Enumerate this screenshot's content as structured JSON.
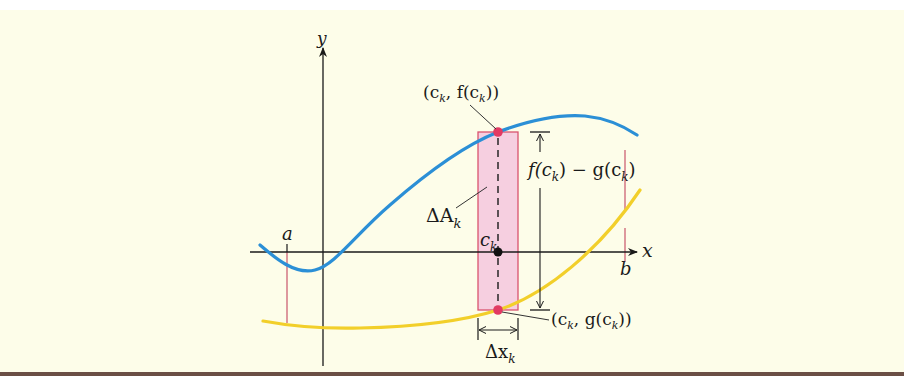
{
  "figure": {
    "colors": {
      "background": "#fdfde9",
      "curve_f": "#2b8fd6",
      "curve_g": "#f2cf2a",
      "rectangle_fill": "#f6cfe0",
      "rectangle_stroke": "#d9546f",
      "point_highlight": "#e23a63",
      "bound_lines": "#c9556b",
      "axes": "#1a1a1a",
      "bottom_rule": "#6b4f45"
    },
    "axes": {
      "x_label": "x",
      "y_label": "y"
    },
    "labels": {
      "a": "a",
      "b": "b",
      "ck": "c",
      "ck_sub": "k",
      "delta_A": "ΔA",
      "delta_A_sub": "k",
      "delta_x": "Δx",
      "delta_x_sub": "k",
      "point_f": {
        "open": "(c",
        "sub1": "k",
        "mid": ", f(c",
        "sub2": "k",
        "close": "))"
      },
      "point_g": {
        "open": "(c",
        "sub1": "k",
        "mid": ", g(c",
        "sub2": "k",
        "close": "))"
      },
      "height": {
        "part1": "f(c",
        "sub1": "k",
        "part2": ") − g(c",
        "sub2": "k",
        "part3": ")"
      }
    },
    "curves": [
      {
        "name": "f",
        "color": "#2b8fd6",
        "shape": "dips below x-axis near origin, rises through (c_k, f(c_k)), peaks, then falls toward b"
      },
      {
        "name": "g",
        "color": "#f2cf2a",
        "shape": "concave-up, below x-axis on left, rising steeply to the right of c_k"
      }
    ]
  }
}
